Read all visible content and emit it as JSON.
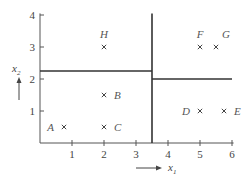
{
  "diagram": {
    "type": "decision-boundary-partition",
    "x_axis": {
      "label": "x",
      "subscript": "1",
      "ticks": [
        "1",
        "2",
        "3",
        "4",
        "5",
        "6"
      ],
      "range": [
        0,
        6
      ]
    },
    "y_axis": {
      "label": "x",
      "subscript": "2",
      "ticks": [
        "1",
        "2",
        "3",
        "4"
      ],
      "range": [
        0,
        4
      ]
    },
    "splits": [
      {
        "orientation": "vertical",
        "x1": 3.5,
        "from_x2": 0,
        "to_x2": 4.05
      },
      {
        "orientation": "horizontal",
        "x2": 2.25,
        "from_x1": 0,
        "to_x1": 3.5
      },
      {
        "orientation": "horizontal",
        "x2": 2.0,
        "from_x1": 3.5,
        "to_x1": 6.0
      }
    ],
    "points": [
      {
        "label": "A",
        "x1": 0.75,
        "x2": 0.5,
        "label_side": "left"
      },
      {
        "label": "B",
        "x1": 2.0,
        "x2": 1.5,
        "label_side": "right"
      },
      {
        "label": "C",
        "x1": 2.0,
        "x2": 0.5,
        "label_side": "right"
      },
      {
        "label": "D",
        "x1": 5.0,
        "x2": 1.0,
        "label_side": "left"
      },
      {
        "label": "E",
        "x1": 5.75,
        "x2": 1.0,
        "label_side": "right"
      },
      {
        "label": "F",
        "x1": 5.0,
        "x2": 3.0,
        "label_side": "above"
      },
      {
        "label": "G",
        "x1": 5.5,
        "x2": 3.0,
        "label_side": "above-right"
      },
      {
        "label": "H",
        "x1": 2.0,
        "x2": 3.0,
        "label_side": "above"
      }
    ]
  }
}
